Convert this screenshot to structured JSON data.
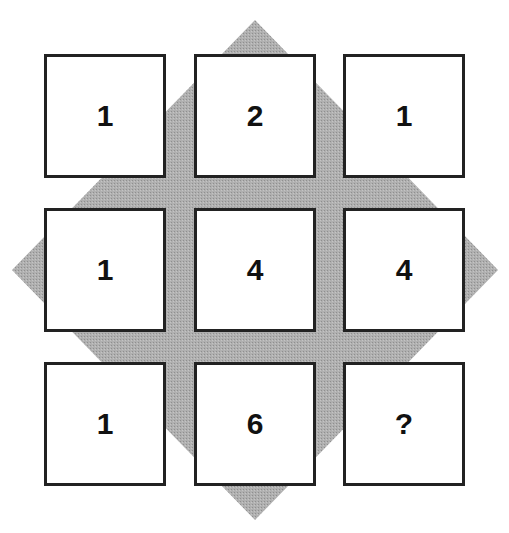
{
  "puzzle": {
    "background_shape": "diamond",
    "colors": {
      "diamond": "#a8a8a8",
      "cell_border": "#222222",
      "cell_fill": "#ffffff",
      "text": "#111111"
    },
    "grid": [
      [
        "1",
        "2",
        "1"
      ],
      [
        "1",
        "4",
        "4"
      ],
      [
        "1",
        "6",
        "?"
      ]
    ]
  }
}
